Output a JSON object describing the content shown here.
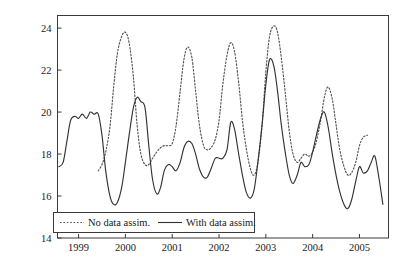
{
  "chart_data": {
    "type": "line",
    "title": "",
    "xlabel": "",
    "ylabel": "Scatter index (%)",
    "xlim": [
      1998.55,
      2005.62
    ],
    "ylim": [
      14,
      24.6
    ],
    "yticks": [
      14,
      16,
      18,
      20,
      22,
      24
    ],
    "xticks": [
      1999,
      2000,
      2001,
      2002,
      2003,
      2004,
      2005
    ],
    "ytick_labels": [
      "14",
      "16",
      "18",
      "20",
      "22",
      "24"
    ],
    "xtick_labels": [
      "1999",
      "2000",
      "2001",
      "2002",
      "2003",
      "2004",
      "2005"
    ],
    "grid": false,
    "legend_position": "bottom-left-inside",
    "series": [
      {
        "name": "No data assim.",
        "style": "dotted",
        "color": "#555555",
        "x": [
          1999.42,
          1999.5,
          1999.58,
          1999.67,
          1999.75,
          1999.83,
          1999.92,
          2000.0,
          2000.08,
          2000.17,
          2000.25,
          2000.33,
          2000.42,
          2000.5,
          2000.58,
          2000.67,
          2000.75,
          2000.83,
          2000.92,
          2001.0,
          2001.08,
          2001.17,
          2001.25,
          2001.33,
          2001.42,
          2001.5,
          2001.58,
          2001.67,
          2001.75,
          2001.83,
          2001.92,
          2002.0,
          2002.08,
          2002.17,
          2002.25,
          2002.33,
          2002.42,
          2002.5,
          2002.58,
          2002.67,
          2002.75,
          2002.83,
          2002.92,
          2003.0,
          2003.08,
          2003.17,
          2003.25,
          2003.33,
          2003.42,
          2003.5,
          2003.58,
          2003.67,
          2003.75,
          2003.83,
          2003.92,
          2004.0,
          2004.08,
          2004.17,
          2004.25,
          2004.33,
          2004.42,
          2004.5,
          2004.58,
          2004.67,
          2004.75,
          2004.83,
          2004.92,
          2005.0,
          2005.08,
          2005.17
        ],
        "y": [
          17.2,
          17.5,
          18.1,
          19.3,
          21.2,
          22.8,
          23.6,
          23.8,
          23.3,
          21.7,
          19.4,
          18.0,
          17.5,
          17.5,
          17.8,
          18.1,
          18.3,
          18.4,
          18.4,
          18.5,
          19.3,
          21.0,
          22.5,
          23.1,
          22.6,
          21.0,
          19.4,
          18.4,
          18.2,
          18.3,
          18.7,
          19.6,
          21.3,
          22.7,
          23.3,
          22.9,
          21.4,
          19.6,
          18.3,
          17.3,
          17.0,
          17.6,
          19.4,
          21.9,
          23.6,
          24.1,
          23.8,
          22.6,
          20.8,
          19.1,
          18.0,
          17.6,
          17.8,
          18.0,
          17.9,
          18.1,
          18.6,
          19.6,
          20.7,
          21.2,
          20.6,
          19.4,
          18.2,
          17.4,
          17.0,
          17.1,
          17.6,
          18.4,
          18.8,
          18.9
        ]
      },
      {
        "name": "With data assim.",
        "style": "solid",
        "color": "#333333",
        "x": [
          1998.58,
          1998.67,
          1998.75,
          1998.83,
          1998.92,
          1999.0,
          1999.08,
          1999.17,
          1999.25,
          1999.33,
          1999.42,
          1999.5,
          1999.58,
          1999.67,
          1999.75,
          1999.83,
          1999.92,
          2000.0,
          2000.08,
          2000.17,
          2000.25,
          2000.33,
          2000.42,
          2000.5,
          2000.58,
          2000.67,
          2000.75,
          2000.83,
          2000.92,
          2001.0,
          2001.08,
          2001.17,
          2001.25,
          2001.33,
          2001.42,
          2001.5,
          2001.58,
          2001.67,
          2001.75,
          2001.83,
          2001.92,
          2002.0,
          2002.08,
          2002.17,
          2002.25,
          2002.33,
          2002.42,
          2002.5,
          2002.58,
          2002.67,
          2002.75,
          2002.83,
          2002.92,
          2003.0,
          2003.08,
          2003.17,
          2003.25,
          2003.33,
          2003.42,
          2003.5,
          2003.58,
          2003.67,
          2003.75,
          2003.83,
          2003.92,
          2004.0,
          2004.08,
          2004.17,
          2004.25,
          2004.33,
          2004.42,
          2004.5,
          2004.58,
          2004.67,
          2004.75,
          2004.83,
          2004.92,
          2005.0,
          2005.08,
          2005.17,
          2005.25,
          2005.33,
          2005.42,
          2005.5
        ],
        "y": [
          17.4,
          17.6,
          18.6,
          19.6,
          19.8,
          19.7,
          19.9,
          19.7,
          20.0,
          19.9,
          19.9,
          18.9,
          17.2,
          16.0,
          15.6,
          15.7,
          16.4,
          17.6,
          18.9,
          20.2,
          20.7,
          20.5,
          20.2,
          18.4,
          16.8,
          16.1,
          16.4,
          17.2,
          17.5,
          17.4,
          17.2,
          17.6,
          18.3,
          18.6,
          18.5,
          18.0,
          17.3,
          16.9,
          16.9,
          17.3,
          17.8,
          17.8,
          17.8,
          18.2,
          19.5,
          19.2,
          18.0,
          17.0,
          16.2,
          15.9,
          16.3,
          17.6,
          19.4,
          21.3,
          22.5,
          22.2,
          21.0,
          19.4,
          18.0,
          17.0,
          16.6,
          17.0,
          17.6,
          17.4,
          17.5,
          18.1,
          18.9,
          19.7,
          20.0,
          19.3,
          18.0,
          17.0,
          16.2,
          15.6,
          15.4,
          15.8,
          16.7,
          17.4,
          17.1,
          17.2,
          17.6,
          17.9,
          16.8,
          15.6
        ]
      }
    ]
  },
  "legend": {
    "entries": [
      {
        "label": "No data assim.",
        "style": "dotted"
      },
      {
        "label": "With data assim.",
        "style": "solid"
      }
    ]
  },
  "axes": {
    "y_axis_title": "Scatter index (%)"
  }
}
